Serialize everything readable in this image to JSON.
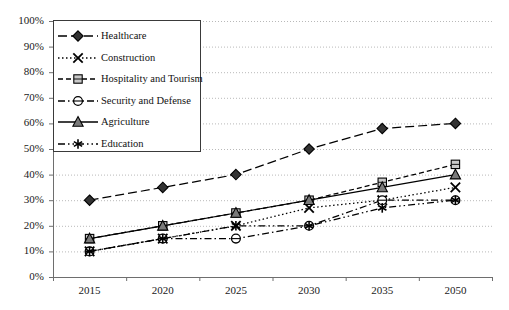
{
  "chart_data": {
    "type": "line",
    "title": "",
    "subtitle": "",
    "xlabel": "",
    "ylabel": "",
    "categories": [
      "2015",
      "2020",
      "2025",
      "2030",
      "2035",
      "2050"
    ],
    "ylim": [
      0,
      100
    ],
    "ytick_labels": [
      "0%",
      "10%",
      "20%",
      "30%",
      "40%",
      "50%",
      "60%",
      "70%",
      "80%",
      "90%",
      "100%"
    ],
    "ytick_values": [
      0,
      10,
      20,
      30,
      40,
      50,
      60,
      70,
      80,
      90,
      100
    ],
    "grid": true,
    "grid_style": "dotted-horizontal",
    "legend_position": "upper-left-inside",
    "series": [
      {
        "name": "Healthcare",
        "values": [
          30,
          35,
          40,
          50,
          58,
          60
        ],
        "marker": "diamond",
        "line_style": "long-dash",
        "color": "#000000",
        "marker_fill": "#333333"
      },
      {
        "name": "Construction",
        "values": [
          10,
          15,
          20,
          27,
          30,
          35
        ],
        "marker": "x-cross",
        "line_style": "dotted",
        "color": "#000000",
        "marker_fill": "#000000"
      },
      {
        "name": "Hospitality and Tourism",
        "values": [
          15,
          20,
          25,
          30,
          37,
          44
        ],
        "marker": "square",
        "line_style": "dashed",
        "color": "#000000",
        "marker_fill": "#c9c9c9"
      },
      {
        "name": "Security and Defense",
        "values": [
          10,
          15,
          15,
          20,
          30,
          30
        ],
        "marker": "circle",
        "line_style": "dash-dot",
        "color": "#000000",
        "marker_fill": "#ffffff"
      },
      {
        "name": "Agriculture",
        "values": [
          15,
          20,
          25,
          30,
          35,
          40
        ],
        "marker": "triangle",
        "line_style": "solid",
        "color": "#000000",
        "marker_fill": "#7a7a7a"
      },
      {
        "name": "Education",
        "values": [
          10,
          15,
          20,
          20,
          27,
          30
        ],
        "marker": "asterisk",
        "line_style": "dash-dot-dot",
        "color": "#000000",
        "marker_fill": "#000000"
      }
    ]
  },
  "legend": {
    "items": [
      {
        "label": "Healthcare"
      },
      {
        "label": "Construction"
      },
      {
        "label": "Hospitality and Tourism"
      },
      {
        "label": "Security and Defense"
      },
      {
        "label": "Agriculture"
      },
      {
        "label": "Education"
      }
    ]
  },
  "axes": {
    "y_labels": [
      "100%",
      "90%",
      "80%",
      "70%",
      "60%",
      "50%",
      "40%",
      "30%",
      "20%",
      "10%",
      "0%"
    ],
    "x_labels": [
      "2015",
      "2020",
      "2025",
      "2030",
      "2035",
      "2050"
    ]
  }
}
